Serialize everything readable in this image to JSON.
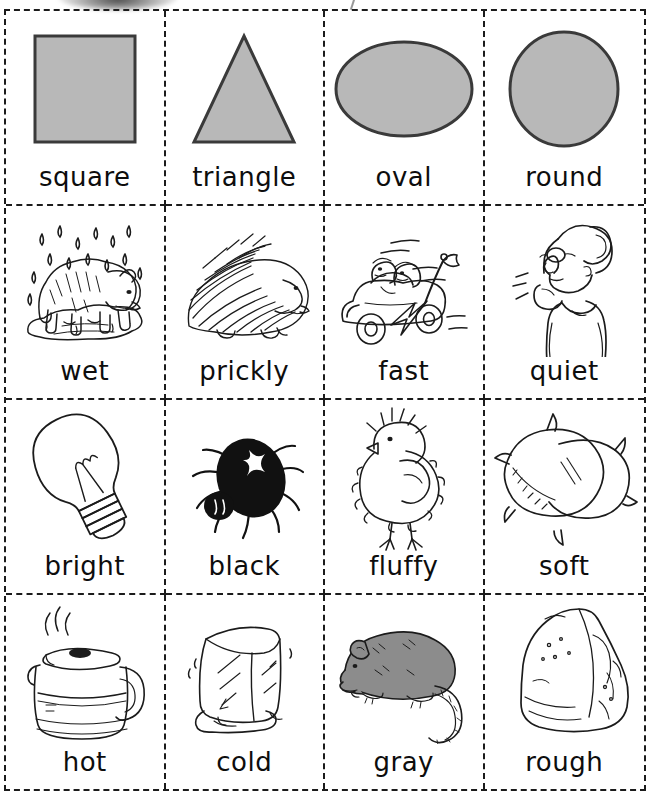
{
  "page": {
    "kind": "cut-apart flashcard worksheet",
    "columns": 4,
    "rows": 4,
    "artifact_note": "scan smudge at top edge"
  },
  "colors": {
    "ink": "#1b1b1b",
    "shape_fill": "#b8b8b8",
    "shape_stroke": "#3a3a3a",
    "mouse_fill": "#8c8c8c",
    "spider_fill": "#111111",
    "paper": "#ffffff"
  },
  "cards": [
    {
      "label": "square",
      "icon": "square-shape-icon",
      "row": 1,
      "col": 1
    },
    {
      "label": "triangle",
      "icon": "triangle-shape-icon",
      "row": 1,
      "col": 2
    },
    {
      "label": "oval",
      "icon": "oval-shape-icon",
      "row": 1,
      "col": 3
    },
    {
      "label": "round",
      "icon": "circle-shape-icon",
      "row": 1,
      "col": 4
    },
    {
      "label": "wet",
      "icon": "wet-dog-in-rain-icon",
      "row": 2,
      "col": 1
    },
    {
      "label": "prickly",
      "icon": "porcupine-icon",
      "row": 2,
      "col": 2
    },
    {
      "label": "fast",
      "icon": "race-car-icon",
      "row": 2,
      "col": 3
    },
    {
      "label": "quiet",
      "icon": "shushing-woman-icon",
      "row": 2,
      "col": 4
    },
    {
      "label": "bright",
      "icon": "light-bulb-icon",
      "row": 3,
      "col": 1
    },
    {
      "label": "black",
      "icon": "black-spider-icon",
      "row": 3,
      "col": 2
    },
    {
      "label": "fluffy",
      "icon": "baby-chick-icon",
      "row": 3,
      "col": 3
    },
    {
      "label": "soft",
      "icon": "pillow-icon",
      "row": 3,
      "col": 4
    },
    {
      "label": "hot",
      "icon": "coffee-pot-icon",
      "row": 4,
      "col": 1
    },
    {
      "label": "cold",
      "icon": "ice-cube-icon",
      "row": 4,
      "col": 2
    },
    {
      "label": "gray",
      "icon": "gray-mouse-icon",
      "row": 4,
      "col": 3
    },
    {
      "label": "rough",
      "icon": "rock-icon",
      "row": 4,
      "col": 4
    }
  ]
}
